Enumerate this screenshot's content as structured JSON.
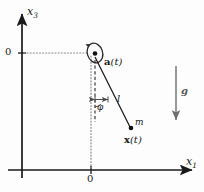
{
  "figure": {
    "kind": "physics-diagram",
    "background_color": "#fdfdfd",
    "stroke_color": "#1a1a1a",
    "guide_color": "#8a8a8a"
  },
  "axes": {
    "vertical_label": "x",
    "vertical_label_sub": "3",
    "horizontal_label": "x",
    "horizontal_label_sub": "1",
    "origin_label_vertical": "0",
    "origin_label_horizontal": "0"
  },
  "labels": {
    "pivot": "a(t)",
    "pivot_bold_part": "a",
    "pivot_rest": "(t)",
    "rod_length": "l",
    "angle": "φ",
    "mass": "m",
    "position": "x(t)",
    "position_bold_part": "x",
    "position_rest": "(t)",
    "gravity": "g"
  },
  "geometry": {
    "pivot_x": 95,
    "pivot_y": 57,
    "mass_x": 131,
    "mass_y": 128,
    "rod_length_px": 79,
    "angle_deg": 27,
    "gravity_arrow_x": 176,
    "gravity_arrow_top": 66,
    "gravity_arrow_bottom": 122
  }
}
